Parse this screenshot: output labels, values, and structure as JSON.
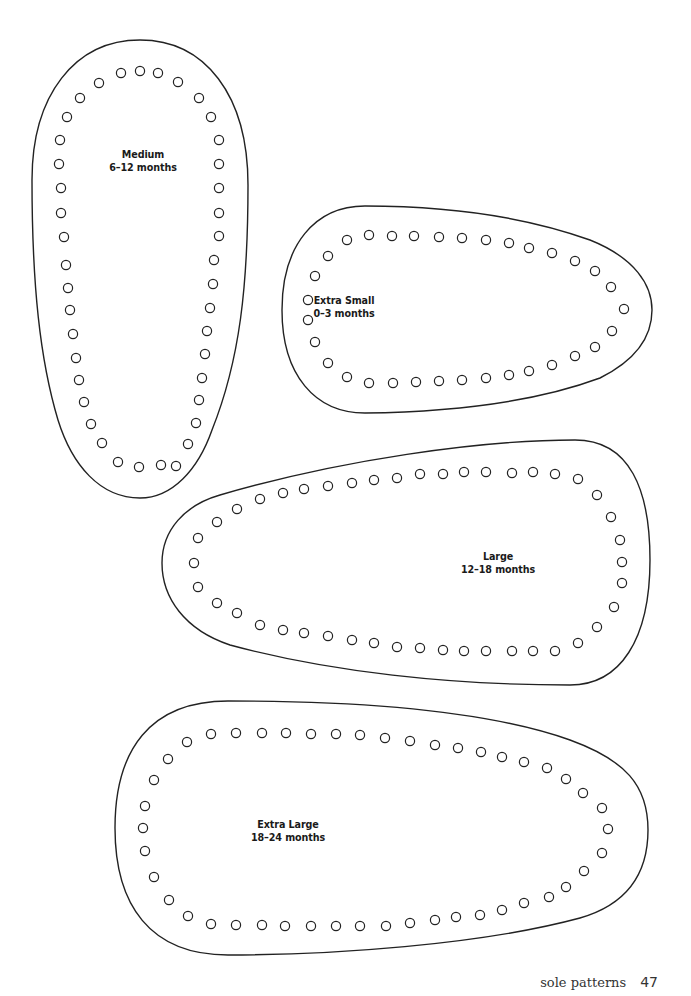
{
  "page": {
    "footer": {
      "section_title": "sole patterns",
      "page_number": "47"
    },
    "line_color": "#222222",
    "background": "#ffffff"
  },
  "patterns": [
    {
      "id": "medium",
      "size": "Medium",
      "age": "6–12 months",
      "label_pos": [
        143,
        161
      ],
      "outline": "M140,40 C205,40 248,95 248,185 C248,285 240,360 212,430 C198,470 172,498 140,498 C100,498 72,465 58,420 C40,360 32,285 32,180 C32,95 75,40 140,40 Z",
      "holes": [
        [
          121,
          73
        ],
        [
          140,
          71
        ],
        [
          158,
          73
        ],
        [
          178,
          82
        ],
        [
          199,
          98
        ],
        [
          211,
          117
        ],
        [
          219,
          140
        ],
        [
          219,
          164
        ],
        [
          219,
          188
        ],
        [
          219,
          213
        ],
        [
          219,
          236
        ],
        [
          214,
          260
        ],
        [
          213,
          284
        ],
        [
          210,
          308
        ],
        [
          207,
          331
        ],
        [
          205,
          354
        ],
        [
          202,
          378
        ],
        [
          199,
          400
        ],
        [
          196,
          423
        ],
        [
          188,
          444
        ],
        [
          176,
          466
        ],
        [
          161,
          465
        ],
        [
          139,
          467
        ],
        [
          118,
          462
        ],
        [
          102,
          443
        ],
        [
          91,
          424
        ],
        [
          84,
          402
        ],
        [
          79,
          380
        ],
        [
          76,
          358
        ],
        [
          73,
          334
        ],
        [
          70,
          310
        ],
        [
          68,
          288
        ],
        [
          66,
          265
        ],
        [
          64,
          237
        ],
        [
          61,
          213
        ],
        [
          61,
          188
        ],
        [
          59,
          164
        ],
        [
          60,
          140
        ],
        [
          67,
          117
        ],
        [
          80,
          98
        ],
        [
          99,
          83
        ]
      ]
    },
    {
      "id": "extra-small",
      "size": "Extra Small",
      "age": "0–3 months",
      "label_pos": [
        344,
        307
      ],
      "outline": "M365,206 C445,206 520,215 590,240 C635,258 652,285 652,310 C652,340 632,362 600,378 C530,404 440,412 365,413 C315,413 282,375 282,310 C282,245 315,206 365,206 Z",
      "holes": [
        [
          347,
          240
        ],
        [
          369,
          235
        ],
        [
          392,
          236
        ],
        [
          414,
          236
        ],
        [
          439,
          237
        ],
        [
          462,
          238
        ],
        [
          486,
          240
        ],
        [
          509,
          243
        ],
        [
          529,
          248
        ],
        [
          552,
          253
        ],
        [
          575,
          261
        ],
        [
          595,
          271
        ],
        [
          611,
          287
        ],
        [
          624,
          309
        ],
        [
          612,
          331
        ],
        [
          595,
          347
        ],
        [
          575,
          356
        ],
        [
          552,
          365
        ],
        [
          529,
          371
        ],
        [
          509,
          375
        ],
        [
          486,
          378
        ],
        [
          462,
          380
        ],
        [
          439,
          381
        ],
        [
          416,
          382
        ],
        [
          393,
          383
        ],
        [
          369,
          383
        ],
        [
          347,
          377
        ],
        [
          328,
          363
        ],
        [
          315,
          342
        ],
        [
          308,
          320
        ],
        [
          308,
          300
        ],
        [
          315,
          276
        ],
        [
          328,
          256
        ]
      ]
    },
    {
      "id": "large",
      "size": "Large",
      "age": "12–18 months",
      "label_pos": [
        498,
        563
      ],
      "outline": "M220,495 C340,460 480,440 575,440 C630,440 650,490 650,560 C650,640 620,685 570,685 C450,685 330,672 230,645 C185,630 162,598 162,563 C162,530 185,505 220,495 Z",
      "holes": [
        [
          217,
          522
        ],
        [
          237,
          509
        ],
        [
          260,
          499
        ],
        [
          283,
          493
        ],
        [
          304,
          489
        ],
        [
          328,
          486
        ],
        [
          352,
          483
        ],
        [
          374,
          480
        ],
        [
          397,
          478
        ],
        [
          420,
          474
        ],
        [
          443,
          474
        ],
        [
          464,
          472
        ],
        [
          486,
          472
        ],
        [
          512,
          473
        ],
        [
          533,
          472
        ],
        [
          555,
          474
        ],
        [
          578,
          479
        ],
        [
          597,
          495
        ],
        [
          611,
          517
        ],
        [
          620,
          540
        ],
        [
          622,
          562
        ],
        [
          622,
          583
        ],
        [
          614,
          607
        ],
        [
          597,
          627
        ],
        [
          578,
          643
        ],
        [
          555,
          651
        ],
        [
          533,
          651
        ],
        [
          512,
          651
        ],
        [
          486,
          651
        ],
        [
          464,
          651
        ],
        [
          443,
          650
        ],
        [
          420,
          648
        ],
        [
          397,
          647
        ],
        [
          374,
          643
        ],
        [
          352,
          640
        ],
        [
          328,
          636
        ],
        [
          304,
          633
        ],
        [
          283,
          630
        ],
        [
          260,
          625
        ],
        [
          237,
          613
        ],
        [
          217,
          603
        ],
        [
          198,
          587
        ],
        [
          194,
          563
        ],
        [
          198,
          538
        ]
      ]
    },
    {
      "id": "extra-large",
      "size": "Extra Large",
      "age": "18–24 months",
      "label_pos": [
        288,
        831
      ],
      "outline": "M228,701 C340,701 480,708 570,740 C625,760 648,785 648,830 C648,875 625,905 580,918 C480,945 330,955 228,955 C150,955 115,905 115,828 C115,750 150,701 228,701 Z",
      "holes": [
        [
          187,
          742
        ],
        [
          211,
          734
        ],
        [
          236,
          733
        ],
        [
          262,
          733
        ],
        [
          286,
          733
        ],
        [
          311,
          734
        ],
        [
          336,
          734
        ],
        [
          360,
          735
        ],
        [
          385,
          738
        ],
        [
          410,
          741
        ],
        [
          435,
          745
        ],
        [
          458,
          748
        ],
        [
          481,
          752
        ],
        [
          502,
          757
        ],
        [
          524,
          762
        ],
        [
          547,
          768
        ],
        [
          566,
          779
        ],
        [
          583,
          793
        ],
        [
          602,
          808
        ],
        [
          608,
          829
        ],
        [
          602,
          853
        ],
        [
          584,
          871
        ],
        [
          566,
          887
        ],
        [
          549,
          897
        ],
        [
          524,
          903
        ],
        [
          502,
          910
        ],
        [
          480,
          915
        ],
        [
          456,
          917
        ],
        [
          435,
          920
        ],
        [
          410,
          923
        ],
        [
          386,
          926
        ],
        [
          360,
          926
        ],
        [
          336,
          926
        ],
        [
          311,
          926
        ],
        [
          285,
          926
        ],
        [
          262,
          925
        ],
        [
          236,
          925
        ],
        [
          211,
          924
        ],
        [
          188,
          916
        ],
        [
          169,
          900
        ],
        [
          154,
          877
        ],
        [
          145,
          851
        ],
        [
          143,
          828
        ],
        [
          145,
          806
        ],
        [
          154,
          780
        ],
        [
          168,
          759
        ]
      ]
    }
  ]
}
